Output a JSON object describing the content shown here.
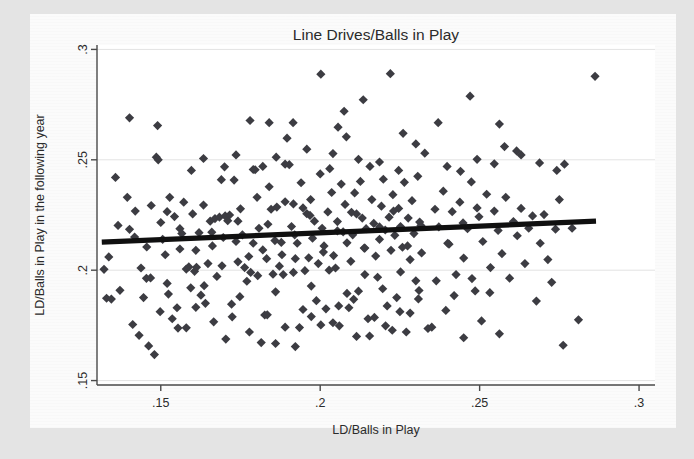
{
  "figure": {
    "kind": "scatter-plot-scan",
    "background_color": "#e4e4e4",
    "card_color": "#fbfbfb",
    "plot_area_color": "#ffffff"
  },
  "chart_data": {
    "type": "scatter",
    "title": "Line Drives/Balls in Play",
    "xlabel": "LD/Balls in Play",
    "ylabel": "LD/Balls in Play in the following year",
    "xlim": [
      0.13,
      0.305
    ],
    "ylim": [
      0.148,
      0.302
    ],
    "xticks": [
      0.15,
      0.2,
      0.25,
      0.3
    ],
    "xticklabels": [
      ".15",
      ".2",
      ".25",
      ".3"
    ],
    "yticks": [
      0.15,
      0.2,
      0.25,
      0.3
    ],
    "yticklabels": [
      ".15",
      ".2",
      ".25",
      ".3"
    ],
    "grid": "horizontal-faint",
    "legend": "none",
    "marker": {
      "shape": "diamond",
      "color": "#3c3c42",
      "size": 4.6
    },
    "fit_line": {
      "name": "linear fit",
      "color": "#101010",
      "width": 5.2,
      "x": [
        0.1315,
        0.2865
      ],
      "y": [
        0.2127,
        0.2222
      ],
      "slope": 0.0613,
      "intercept": 0.2046
    },
    "n_points": 302,
    "points": [
      [
        0.1322,
        0.2004
      ],
      [
        0.133,
        0.1873
      ],
      [
        0.1337,
        0.206
      ],
      [
        0.1345,
        0.1869
      ],
      [
        0.1358,
        0.242
      ],
      [
        0.1366,
        0.2203
      ],
      [
        0.1372,
        0.1909
      ],
      [
        0.1395,
        0.233
      ],
      [
        0.1402,
        0.2185
      ],
      [
        0.1412,
        0.1754
      ],
      [
        0.142,
        0.2268
      ],
      [
        0.1432,
        0.1705
      ],
      [
        0.1438,
        0.201
      ],
      [
        0.1446,
        0.1876
      ],
      [
        0.1455,
        0.1963
      ],
      [
        0.1462,
        0.1657
      ],
      [
        0.147,
        0.2293
      ],
      [
        0.148,
        0.1618
      ],
      [
        0.1486,
        0.2512
      ],
      [
        0.1492,
        0.25
      ],
      [
        0.15,
        0.2216
      ],
      [
        0.1506,
        0.214
      ],
      [
        0.1514,
        0.207
      ],
      [
        0.152,
        0.194
      ],
      [
        0.1528,
        0.233
      ],
      [
        0.1536,
        0.178
      ],
      [
        0.1543,
        0.2243
      ],
      [
        0.1551,
        0.183
      ],
      [
        0.156,
        0.2096
      ],
      [
        0.1566,
        0.2166
      ],
      [
        0.1572,
        0.2308
      ],
      [
        0.158,
        0.1739
      ],
      [
        0.1588,
        0.2015
      ],
      [
        0.1594,
        0.192
      ],
      [
        0.16,
        0.2255
      ],
      [
        0.1606,
        0.1995
      ],
      [
        0.1612,
        0.2013
      ],
      [
        0.162,
        0.217
      ],
      [
        0.1626,
        0.1887
      ],
      [
        0.1634,
        0.2295
      ],
      [
        0.164,
        0.185
      ],
      [
        0.1648,
        0.203
      ],
      [
        0.1655,
        0.2222
      ],
      [
        0.1662,
        0.211
      ],
      [
        0.167,
        0.2234
      ],
      [
        0.1676,
        0.1972
      ],
      [
        0.1684,
        0.224
      ],
      [
        0.169,
        0.241
      ],
      [
        0.1696,
        0.2148
      ],
      [
        0.1704,
        0.1688
      ],
      [
        0.171,
        0.2224
      ],
      [
        0.1716,
        0.225
      ],
      [
        0.1724,
        0.1789
      ],
      [
        0.173,
        0.2408
      ],
      [
        0.1736,
        0.213
      ],
      [
        0.1742,
        0.2222
      ],
      [
        0.175,
        0.2278
      ],
      [
        0.1756,
        0.216
      ],
      [
        0.1763,
        0.2012
      ],
      [
        0.177,
        0.195
      ],
      [
        0.1776,
        0.2062
      ],
      [
        0.1782,
        0.199
      ],
      [
        0.179,
        0.2456
      ],
      [
        0.1796,
        0.2455
      ],
      [
        0.1802,
        0.233
      ],
      [
        0.1808,
        0.219
      ],
      [
        0.1815,
        0.1672
      ],
      [
        0.182,
        0.2092
      ],
      [
        0.1826,
        0.1797
      ],
      [
        0.1832,
        0.2052
      ],
      [
        0.184,
        0.2378
      ],
      [
        0.1846,
        0.2276
      ],
      [
        0.1852,
        0.1982
      ],
      [
        0.1858,
        0.2134
      ],
      [
        0.1864,
        0.2286
      ],
      [
        0.1872,
        0.2018
      ],
      [
        0.1878,
        0.2126
      ],
      [
        0.1884,
        0.198
      ],
      [
        0.189,
        0.231
      ],
      [
        0.1896,
        0.2598
      ],
      [
        0.1903,
        0.2478
      ],
      [
        0.191,
        0.2198
      ],
      [
        0.1916,
        0.23
      ],
      [
        0.1922,
        0.2052
      ],
      [
        0.1928,
        0.2122
      ],
      [
        0.1935,
        0.174
      ],
      [
        0.194,
        0.2396
      ],
      [
        0.1946,
        0.2282
      ],
      [
        0.1952,
        0.1998
      ],
      [
        0.1958,
        0.2256
      ],
      [
        0.1964,
        0.2056
      ],
      [
        0.197,
        0.232
      ],
      [
        0.1976,
        0.2145
      ],
      [
        0.1982,
        0.2222
      ],
      [
        0.1988,
        0.1862
      ],
      [
        0.1994,
        0.203
      ],
      [
        0.2,
        0.2436
      ],
      [
        0.2006,
        0.219
      ],
      [
        0.2012,
        0.211
      ],
      [
        0.2018,
        0.1825
      ],
      [
        0.2024,
        0.2264
      ],
      [
        0.203,
        0.246
      ],
      [
        0.2036,
        0.2352
      ],
      [
        0.2042,
        0.2066
      ],
      [
        0.2048,
        0.201
      ],
      [
        0.2054,
        0.222
      ],
      [
        0.206,
        0.1748
      ],
      [
        0.2066,
        0.239
      ],
      [
        0.2072,
        0.2174
      ],
      [
        0.2078,
        0.2298
      ],
      [
        0.2084,
        0.2124
      ],
      [
        0.209,
        0.183
      ],
      [
        0.2096,
        0.204
      ],
      [
        0.2102,
        0.216
      ],
      [
        0.2108,
        0.235
      ],
      [
        0.2114,
        0.2255
      ],
      [
        0.212,
        0.1905
      ],
      [
        0.2126,
        0.2402
      ],
      [
        0.2132,
        0.2236
      ],
      [
        0.2138,
        0.21
      ],
      [
        0.2144,
        0.2188
      ],
      [
        0.215,
        0.178
      ],
      [
        0.2156,
        0.247
      ],
      [
        0.2162,
        0.232
      ],
      [
        0.2168,
        0.2212
      ],
      [
        0.2174,
        0.2064
      ],
      [
        0.218,
        0.1968
      ],
      [
        0.2186,
        0.214
      ],
      [
        0.2192,
        0.229
      ],
      [
        0.2198,
        0.2412
      ],
      [
        0.2204,
        0.2182
      ],
      [
        0.221,
        0.1838
      ],
      [
        0.2216,
        0.224
      ],
      [
        0.2222,
        0.209
      ],
      [
        0.2228,
        0.2342
      ],
      [
        0.2234,
        0.2158
      ],
      [
        0.224,
        0.1876
      ],
      [
        0.2246,
        0.228
      ],
      [
        0.2252,
        0.2198
      ],
      [
        0.2258,
        0.2104
      ],
      [
        0.2264,
        0.2398
      ],
      [
        0.227,
        0.172
      ],
      [
        0.2276,
        0.2236
      ],
      [
        0.2282,
        0.2048
      ],
      [
        0.2288,
        0.2315
      ],
      [
        0.2294,
        0.2166
      ],
      [
        0.23,
        0.1952
      ],
      [
        0.2306,
        0.2425
      ],
      [
        0.2312,
        0.2218
      ],
      [
        0.2318,
        0.2078
      ],
      [
        0.186,
        0.1668
      ],
      [
        0.1922,
        0.1654
      ],
      [
        0.1972,
        0.179
      ],
      [
        0.204,
        0.1762
      ],
      [
        0.2105,
        0.1868
      ],
      [
        0.2155,
        0.1702
      ],
      [
        0.2205,
        0.1748
      ],
      [
        0.225,
        0.1812
      ],
      [
        0.231,
        0.1908
      ],
      [
        0.235,
        0.1742
      ],
      [
        0.2372,
        0.2196
      ],
      [
        0.2386,
        0.2358
      ],
      [
        0.24,
        0.2122
      ],
      [
        0.2414,
        0.2265
      ],
      [
        0.2426,
        0.198
      ],
      [
        0.2438,
        0.2308
      ],
      [
        0.245,
        0.2055
      ],
      [
        0.2462,
        0.2188
      ],
      [
        0.2474,
        0.24
      ],
      [
        0.2486,
        0.1906
      ],
      [
        0.2498,
        0.2242
      ],
      [
        0.251,
        0.213
      ],
      [
        0.2522,
        0.2344
      ],
      [
        0.2534,
        0.2012
      ],
      [
        0.2546,
        0.2268
      ],
      [
        0.2558,
        0.218
      ],
      [
        0.257,
        0.2075
      ],
      [
        0.2582,
        0.233
      ],
      [
        0.2594,
        0.1964
      ],
      [
        0.2606,
        0.222
      ],
      [
        0.2618,
        0.2156
      ],
      [
        0.263,
        0.228
      ],
      [
        0.2642,
        0.203
      ],
      [
        0.2654,
        0.219
      ],
      [
        0.2666,
        0.2246
      ],
      [
        0.2678,
        0.186
      ],
      [
        0.269,
        0.2122
      ],
      [
        0.2702,
        0.2252
      ],
      [
        0.2714,
        0.2048
      ],
      [
        0.2726,
        0.1945
      ],
      [
        0.2738,
        0.2186
      ],
      [
        0.275,
        0.232
      ],
      [
        0.2762,
        0.166
      ],
      [
        0.279,
        0.219
      ],
      [
        0.281,
        0.1775
      ],
      [
        0.2862,
        0.2878
      ],
      [
        0.247,
        0.2788
      ],
      [
        0.222,
        0.289
      ],
      [
        0.2002,
        0.2888
      ],
      [
        0.2075,
        0.272
      ],
      [
        0.184,
        0.2668
      ],
      [
        0.2135,
        0.2772
      ],
      [
        0.237,
        0.2668
      ],
      [
        0.2562,
        0.2662
      ],
      [
        0.2616,
        0.254
      ],
      [
        0.178,
        0.2678
      ],
      [
        0.149,
        0.2655
      ],
      [
        0.1402,
        0.269
      ],
      [
        0.1915,
        0.2668
      ],
      [
        0.2056,
        0.2648
      ],
      [
        0.2082,
        0.2604
      ],
      [
        0.226,
        0.262
      ],
      [
        0.23,
        0.2572
      ],
      [
        0.2578,
        0.256
      ],
      [
        0.263,
        0.2522
      ],
      [
        0.17,
        0.2468
      ],
      [
        0.1736,
        0.2522
      ],
      [
        0.182,
        0.247
      ],
      [
        0.1958,
        0.2548
      ],
      [
        0.1862,
        0.2512
      ],
      [
        0.212,
        0.2502
      ],
      [
        0.2186,
        0.249
      ],
      [
        0.2328,
        0.253
      ],
      [
        0.2398,
        0.247
      ],
      [
        0.2492,
        0.2502
      ],
      [
        0.1596,
        0.2452
      ],
      [
        0.1634,
        0.2506
      ],
      [
        0.189,
        0.248
      ],
      [
        0.204,
        0.2528
      ],
      [
        0.2246,
        0.2452
      ],
      [
        0.244,
        0.2448
      ],
      [
        0.2546,
        0.2482
      ],
      [
        0.2688,
        0.2486
      ],
      [
        0.2742,
        0.2452
      ],
      [
        0.2766,
        0.248
      ],
      [
        0.1418,
        0.215
      ],
      [
        0.1456,
        0.2105
      ],
      [
        0.152,
        0.2265
      ],
      [
        0.156,
        0.2188
      ],
      [
        0.161,
        0.209
      ],
      [
        0.166,
        0.2172
      ],
      [
        0.1702,
        0.2246
      ],
      [
        0.1742,
        0.2038
      ],
      [
        0.179,
        0.2122
      ],
      [
        0.1836,
        0.2208
      ],
      [
        0.188,
        0.207
      ],
      [
        0.192,
        0.216
      ],
      [
        0.1968,
        0.2248
      ],
      [
        0.201,
        0.2082
      ],
      [
        0.2054,
        0.2178
      ],
      [
        0.2098,
        0.2262
      ],
      [
        0.214,
        0.21
      ],
      [
        0.2186,
        0.2196
      ],
      [
        0.223,
        0.2268
      ],
      [
        0.2274,
        0.211
      ],
      [
        0.2316,
        0.2202
      ],
      [
        0.236,
        0.2276
      ],
      [
        0.2404,
        0.2118
      ],
      [
        0.2448,
        0.2214
      ],
      [
        0.2492,
        0.2282
      ],
      [
        0.1468,
        0.1965
      ],
      [
        0.1524,
        0.1892
      ],
      [
        0.158,
        0.2005
      ],
      [
        0.1636,
        0.193
      ],
      [
        0.1692,
        0.202
      ],
      [
        0.1748,
        0.188
      ],
      [
        0.1804,
        0.1975
      ],
      [
        0.186,
        0.1902
      ],
      [
        0.1916,
        0.199
      ],
      [
        0.1972,
        0.1928
      ],
      [
        0.2028,
        0.2
      ],
      [
        0.2084,
        0.1895
      ],
      [
        0.214,
        0.198
      ],
      [
        0.2196,
        0.1916
      ],
      [
        0.2252,
        0.1992
      ],
      [
        0.2308,
        0.187
      ],
      [
        0.2364,
        0.1952
      ],
      [
        0.242,
        0.1885
      ],
      [
        0.2476,
        0.1962
      ],
      [
        0.2532,
        0.1898
      ],
      [
        0.1498,
        0.1812
      ],
      [
        0.1554,
        0.1738
      ],
      [
        0.161,
        0.1832
      ],
      [
        0.1666,
        0.1766
      ],
      [
        0.1722,
        0.1846
      ],
      [
        0.1778,
        0.172
      ],
      [
        0.1834,
        0.1798
      ],
      [
        0.189,
        0.1742
      ],
      [
        0.1946,
        0.1822
      ],
      [
        0.2002,
        0.1752
      ],
      [
        0.2058,
        0.1838
      ],
      [
        0.2114,
        0.17
      ],
      [
        0.217,
        0.1786
      ],
      [
        0.2226,
        0.1728
      ],
      [
        0.2282,
        0.1806
      ],
      [
        0.2338,
        0.1736
      ],
      [
        0.2394,
        0.1818
      ],
      [
        0.245,
        0.1694
      ],
      [
        0.2506,
        0.177
      ],
      [
        0.2562,
        0.1712
      ]
    ]
  }
}
